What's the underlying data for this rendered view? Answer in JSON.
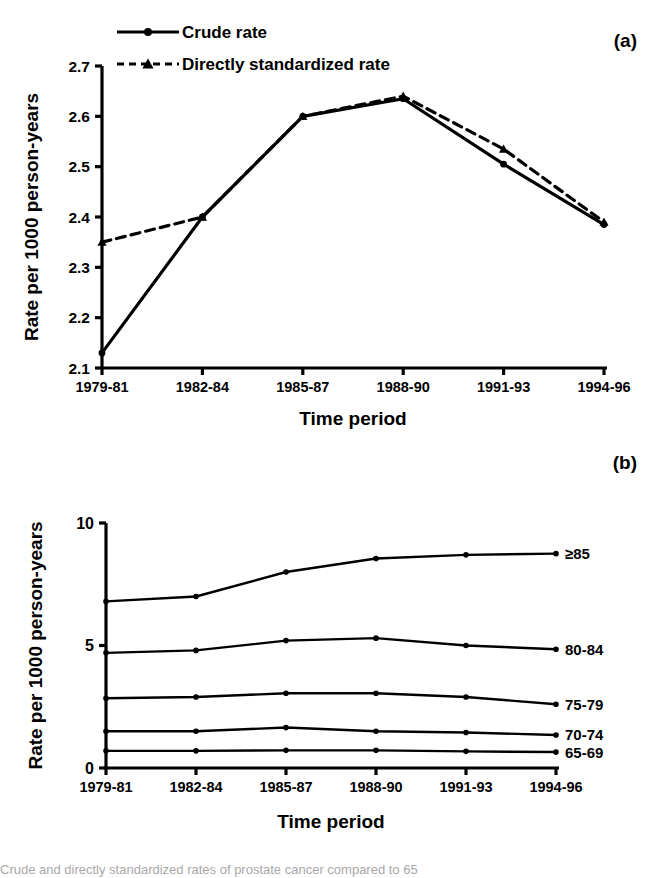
{
  "figure": {
    "panel_a_label": "(a)",
    "panel_b_label": "(b)",
    "caption": "Crude and directly standardized rates of prostate cancer compared to 65"
  },
  "chart_data": [
    {
      "type": "line",
      "panel": "(a)",
      "title": "",
      "xlabel": "Time period",
      "ylabel": "Rate per 1000 person-years",
      "categories": [
        "1979-81",
        "1982-84",
        "1985-87",
        "1988-90",
        "1991-93",
        "1994-96"
      ],
      "ylim": [
        2.1,
        2.7
      ],
      "yticks": [
        "2.1",
        "2.2",
        "2.3",
        "2.4",
        "2.5",
        "2.6",
        "2.7"
      ],
      "ytick_values": [
        2.1,
        2.2,
        2.3,
        2.4,
        2.5,
        2.6,
        2.7
      ],
      "grid": false,
      "legend_position": "top-left",
      "series": [
        {
          "name": "Crude rate",
          "style": "solid",
          "marker": "circle",
          "values": [
            2.13,
            2.4,
            2.6,
            2.635,
            2.505,
            2.385
          ]
        },
        {
          "name": "Directly standardized rate",
          "style": "dashed",
          "marker": "triangle",
          "values": [
            2.35,
            2.4,
            2.6,
            2.64,
            2.535,
            2.39
          ]
        }
      ]
    },
    {
      "type": "line",
      "panel": "(b)",
      "title": "",
      "xlabel": "Time period",
      "ylabel": "Rate per 1000 person-years",
      "categories": [
        "1979-81",
        "1982-84",
        "1985-87",
        "1988-90",
        "1991-93",
        "1994-96"
      ],
      "ylim": [
        0,
        10
      ],
      "yticks": [
        "0",
        "5",
        "10"
      ],
      "ytick_values": [
        0,
        5,
        10
      ],
      "grid": false,
      "legend_position": "right-inline",
      "series": [
        {
          "name": "≥85",
          "style": "solid",
          "marker": "circle",
          "values": [
            6.8,
            7.0,
            8.0,
            8.55,
            8.7,
            8.75
          ]
        },
        {
          "name": "80-84",
          "style": "solid",
          "marker": "circle",
          "values": [
            4.7,
            4.8,
            5.2,
            5.3,
            5.0,
            4.85
          ]
        },
        {
          "name": "75-79",
          "style": "solid",
          "marker": "circle",
          "values": [
            2.85,
            2.9,
            3.05,
            3.05,
            2.9,
            2.6
          ]
        },
        {
          "name": "70-74",
          "style": "solid",
          "marker": "circle",
          "values": [
            1.5,
            1.5,
            1.65,
            1.5,
            1.45,
            1.35
          ]
        },
        {
          "name": "65-69",
          "style": "solid",
          "marker": "circle",
          "values": [
            0.7,
            0.7,
            0.72,
            0.72,
            0.68,
            0.65
          ]
        }
      ]
    }
  ]
}
